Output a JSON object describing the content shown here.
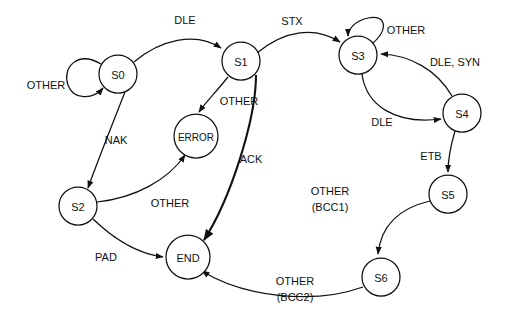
{
  "diagram": {
    "background_color": "#ffffff",
    "stroke_color": "#111111",
    "nodes": [
      {
        "id": "S0",
        "label": "S0",
        "cx": 118,
        "cy": 74,
        "r": 19
      },
      {
        "id": "S1",
        "label": "S1",
        "cx": 241,
        "cy": 61,
        "r": 19
      },
      {
        "id": "S2",
        "label": "S2",
        "cx": 78,
        "cy": 206,
        "r": 19
      },
      {
        "id": "S3",
        "label": "S3",
        "cx": 358,
        "cy": 55,
        "r": 19
      },
      {
        "id": "S4",
        "label": "S4",
        "cx": 462,
        "cy": 113,
        "r": 19
      },
      {
        "id": "S5",
        "label": "S5",
        "cx": 448,
        "cy": 194,
        "r": 19
      },
      {
        "id": "S6",
        "label": "S6",
        "cx": 381,
        "cy": 277,
        "r": 19
      },
      {
        "id": "ERROR",
        "label": "ERROR",
        "cx": 196,
        "cy": 136,
        "r": 22
      },
      {
        "id": "END",
        "label": "END",
        "cx": 188,
        "cy": 257,
        "r": 22
      }
    ],
    "edges": [
      {
        "id": "e-s0-self",
        "from": "S0",
        "to": "S0",
        "label": "OTHER",
        "label_x": 46,
        "label_y": 85
      },
      {
        "id": "e-s0-s1",
        "from": "S0",
        "to": "S1",
        "label": "DLE",
        "label_x": 185,
        "label_y": 20
      },
      {
        "id": "e-s0-s2",
        "from": "S0",
        "to": "S2",
        "label": "NAK",
        "label_x": 116,
        "label_y": 140
      },
      {
        "id": "e-s1-s3",
        "from": "S1",
        "to": "S3",
        "label": "STX",
        "label_x": 292,
        "label_y": 21
      },
      {
        "id": "e-s1-error",
        "from": "S1",
        "to": "ERROR",
        "label": "OTHER",
        "label_x": 239,
        "label_y": 101
      },
      {
        "id": "e-s1-end",
        "from": "S1",
        "to": "END",
        "label": "ACK",
        "label_x": 251,
        "label_y": 159
      },
      {
        "id": "e-s2-error",
        "from": "S2",
        "to": "ERROR",
        "label": "OTHER",
        "label_x": 170,
        "label_y": 203
      },
      {
        "id": "e-s2-end",
        "from": "S2",
        "to": "END",
        "label": "PAD",
        "label_x": 106,
        "label_y": 257
      },
      {
        "id": "e-s3-self",
        "from": "S3",
        "to": "S3",
        "label": "OTHER",
        "label_x": 406,
        "label_y": 30
      },
      {
        "id": "e-s3-s4",
        "from": "S3",
        "to": "S4",
        "label": "DLE",
        "label_x": 382,
        "label_y": 122
      },
      {
        "id": "e-s4-s3",
        "from": "S4",
        "to": "S3",
        "label": "DLE, SYN",
        "label_x": 455,
        "label_y": 62
      },
      {
        "id": "e-s4-s5",
        "from": "S4",
        "to": "S5",
        "label": "ETB",
        "label_x": 431,
        "label_y": 156
      },
      {
        "id": "e-s5-s6",
        "from": "S5",
        "to": "S6",
        "label_line1": "OTHER",
        "label_line2": "(BCC1)",
        "label_x": 330,
        "label_y": 191
      },
      {
        "id": "e-s6-end",
        "from": "S6",
        "to": "END",
        "label_line1": "OTHER",
        "label_line2": "(BCC2)",
        "label_x": 295,
        "label_y": 281
      }
    ]
  }
}
